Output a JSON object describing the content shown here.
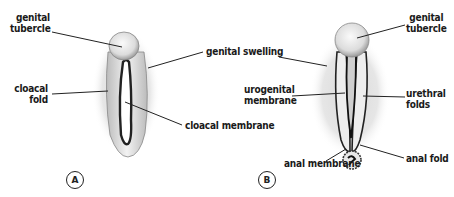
{
  "figure": {
    "panels": [
      {
        "id": "A",
        "badge": "A",
        "labels": {
          "genital_tubercle": "genital\ntubercle",
          "genital_tubercle_l1": "genital",
          "genital_tubercle_l2": "tubercle",
          "genital_swelling": "genital swelling",
          "cloacal_fold_l1": "cloacal",
          "cloacal_fold_l2": "fold",
          "cloacal_membrane": "cloacal membrane"
        }
      },
      {
        "id": "B",
        "badge": "B",
        "labels": {
          "genital_tubercle_l1": "genital",
          "genital_tubercle_l2": "tubercle",
          "urogenital_membrane_l1": "urogenital",
          "urogenital_membrane_l2": "membrane",
          "urethral_folds_l1": "urethral",
          "urethral_folds_l2": "folds",
          "anal_membrane": "anal membrane",
          "anal_fold": "anal fold"
        }
      }
    ],
    "colors": {
      "ink": "#1a1a1a",
      "stipple": "#bdbdbd",
      "background": "#ffffff"
    }
  }
}
